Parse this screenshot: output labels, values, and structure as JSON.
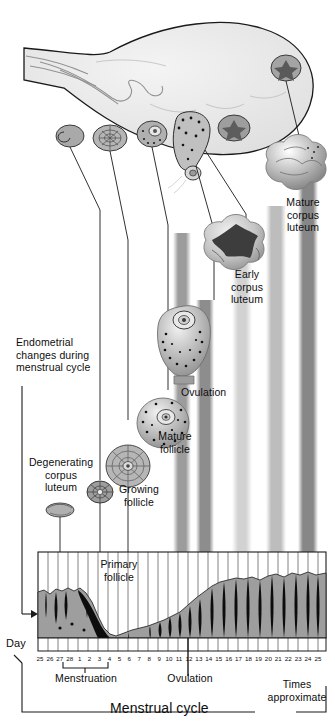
{
  "figure": {
    "title": "Menstrual cycle",
    "axis_label": "Day",
    "note": "Times approximate"
  },
  "labels": {
    "endometrial": "Endometrial\nchanges during\nmenstrual cycle",
    "degenerating_cl": "Degenerating\ncorpus\nluteum",
    "growing_follicle": "Growing\nfollicle",
    "primary_follicle": "Primary\nfollicle",
    "mature_follicle": "Mature\nfollicle",
    "ovulation_structure": "Ovulation",
    "early_cl": "Early\ncorpus\nluteum",
    "mature_cl": "Mature\ncorpus\nluteum",
    "menstruation": "Menstruation",
    "ovulation_axis": "Ovulation",
    "times_approximate": "Times\napproximate",
    "menstrual_cycle": "Menstrual cycle",
    "day": "Day"
  },
  "chart_data": {
    "type": "area",
    "title": "Menstrual cycle",
    "xlabel": "Day",
    "ylabel": "Endometrial thickness",
    "categories": [
      "25",
      "26",
      "27",
      "28",
      "1",
      "2",
      "3",
      "4",
      "5",
      "6",
      "7",
      "8",
      "9",
      "10",
      "11",
      "12",
      "13",
      "14",
      "15",
      "16",
      "17",
      "18",
      "19",
      "20",
      "21",
      "22",
      "23",
      "24",
      "25"
    ],
    "values": [
      86,
      84,
      82,
      80,
      62,
      40,
      20,
      10,
      8,
      9,
      10,
      12,
      14,
      17,
      20,
      24,
      28,
      32,
      38,
      44,
      50,
      56,
      60,
      64,
      68,
      72,
      76,
      80,
      84
    ],
    "ylim": [
      0,
      100
    ],
    "grid": true,
    "legend": "none",
    "annotations": [
      {
        "label": "Menstruation",
        "from": "28",
        "to": "4"
      },
      {
        "label": "Ovulation",
        "at": "14"
      },
      {
        "label": "Times approximate",
        "at": "24"
      }
    ],
    "bands": [
      {
        "name": "mature-follicle-band",
        "center_day": "12",
        "shade": "#9a9a9a"
      },
      {
        "name": "ovulation-band",
        "center_day": "14",
        "shade": "#8f8f8f"
      },
      {
        "name": "early-corpus-luteum-band",
        "center_day": "17",
        "shade": "#c8c8c8"
      },
      {
        "name": "mature-corpus-luteum-band",
        "center_day": "21",
        "shade": "#b4b4b4"
      },
      {
        "name": "degenerating-band",
        "center_day": "24",
        "shade": "#8a8a8a"
      }
    ]
  },
  "structures": [
    {
      "name": "ovary",
      "caption": ""
    },
    {
      "name": "primary-follicle",
      "caption": "Primary\nfollicle"
    },
    {
      "name": "growing-follicle",
      "caption": "Growing\nfollicle"
    },
    {
      "name": "mature-follicle",
      "caption": "Mature\nfollicle"
    },
    {
      "name": "ovulation",
      "caption": "Ovulation"
    },
    {
      "name": "early-corpus-luteum",
      "caption": "Early\ncorpus\nluteum"
    },
    {
      "name": "mature-corpus-luteum",
      "caption": "Mature\ncorpus\nluteum"
    },
    {
      "name": "degenerating-corpus-luteum",
      "caption": "Degenerating\ncorpus\nluteum"
    }
  ],
  "colors": {
    "ink": "#111111",
    "ovary_fill": "#ececec",
    "endometrium": "#9e9e9e",
    "band_light": "#d8d8d8",
    "band_dark": "#8a8a8a"
  }
}
